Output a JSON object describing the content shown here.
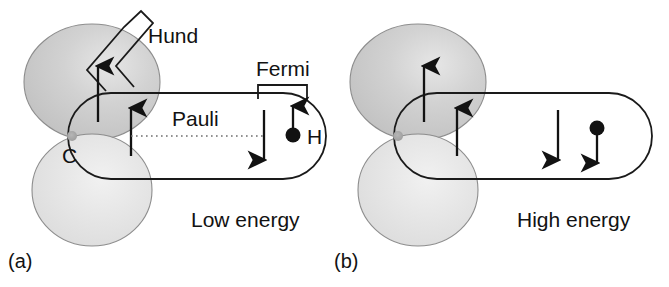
{
  "figure": {
    "background_color": "#ffffff",
    "stroke_color": "#1a1a1a",
    "lobe_upper_color": "#c9c9c9",
    "lobe_lower_color": "#e2e2e2",
    "nucleus_color": "#a8a8a8"
  },
  "panels": [
    {
      "id": "a",
      "panel_label": "(a)",
      "energy_label": "Low energy",
      "atom_label_carbon": "C",
      "atom_label_hydrogen": "H",
      "annotations": {
        "hund": "Hund",
        "pauli": "Pauli",
        "fermi": "Fermi"
      },
      "spins": {
        "carbon_lobe_spin": "up",
        "carbon_bond_spin": "up",
        "bond_electron_spin": "down",
        "hydrogen_spin": "up"
      }
    },
    {
      "id": "b",
      "panel_label": "(b)",
      "energy_label": "High energy",
      "annotations": {},
      "spins": {
        "carbon_lobe_spin": "up",
        "carbon_bond_spin": "up",
        "bond_electron_spin": "down",
        "hydrogen_spin": "down"
      }
    }
  ]
}
